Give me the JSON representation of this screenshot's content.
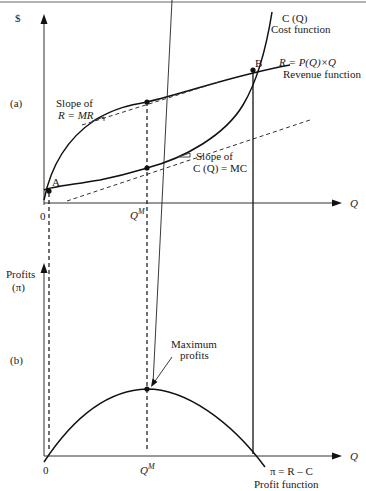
{
  "figure": {
    "panel_a": {
      "label": "(a)",
      "y_axis_label": "$",
      "x_axis_label": "Q",
      "origin_label": "0",
      "qm_label": "Q",
      "qm_superscript": "M",
      "cost_curve": {
        "name": "C (Q)",
        "caption": "Cost function"
      },
      "revenue_curve": {
        "name": "R = P(Q)×Q",
        "caption": "Revenue function"
      },
      "points": {
        "a": "A",
        "b": "B"
      },
      "revenue_slope_note": {
        "line1": "Slope of",
        "line2": "R = MR"
      },
      "cost_slope_note": {
        "line1": "Slope of",
        "line2": "C (Q) = MC"
      }
    },
    "panel_b": {
      "label": "(b)",
      "y_axis_label_line1": "Profits",
      "y_axis_label_line2": "(π)",
      "x_axis_label": "Q",
      "origin_label": "0",
      "qm_label": "Q",
      "qm_superscript": "M",
      "max_note_line1": "Maximum",
      "max_note_line2": "profits",
      "profit_curve": {
        "name": "π = R – C",
        "caption": "Profit function"
      }
    }
  }
}
